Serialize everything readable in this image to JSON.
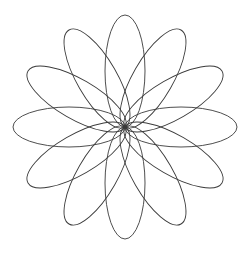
{
  "document": {
    "title": "Spirograph Rosette",
    "background_color": "#ffffff",
    "width": 248,
    "height": 256
  },
  "figure": {
    "name": "rosette-of-ellipses",
    "stroke_color": "#3a3a3a",
    "stroke_width": 0.9,
    "fill": "none"
  },
  "chart_data": {
    "type": "line",
    "subtitle": "",
    "xlabel": "",
    "ylabel": "",
    "grid": false,
    "legend_position": "none",
    "xlim": [
      0,
      248
    ],
    "ylim": [
      0,
      256
    ],
    "geometry": {
      "center_x": 125,
      "center_y": 127,
      "ellipse_count": 12,
      "semi_major_axis": 56,
      "semi_minor_axis": 20,
      "angle_step_degrees": 30,
      "start_angle_degrees": -90,
      "petal_tip_radius": 112,
      "bounding_box": {
        "left": 13,
        "top": 13,
        "right": 238,
        "bottom": 240
      }
    },
    "series": [
      {
        "name": "ellipse-01",
        "rotation_degrees": -90,
        "tip_x": 125,
        "tip_y": 15
      },
      {
        "name": "ellipse-02",
        "rotation_degrees": -60,
        "tip_x": 181,
        "tip_y": 30
      },
      {
        "name": "ellipse-03",
        "rotation_degrees": -30,
        "tip_x": 222,
        "tip_y": 71
      },
      {
        "name": "ellipse-04",
        "rotation_degrees": 0,
        "tip_x": 237,
        "tip_y": 127
      },
      {
        "name": "ellipse-05",
        "rotation_degrees": 30,
        "tip_x": 222,
        "tip_y": 183
      },
      {
        "name": "ellipse-06",
        "rotation_degrees": 60,
        "tip_x": 181,
        "tip_y": 224
      },
      {
        "name": "ellipse-07",
        "rotation_degrees": 90,
        "tip_x": 125,
        "tip_y": 239
      },
      {
        "name": "ellipse-08",
        "rotation_degrees": 120,
        "tip_x": 69,
        "tip_y": 224
      },
      {
        "name": "ellipse-09",
        "rotation_degrees": 150,
        "tip_x": 28,
        "tip_y": 183
      },
      {
        "name": "ellipse-10",
        "rotation_degrees": 180,
        "tip_x": 13,
        "tip_y": 127
      },
      {
        "name": "ellipse-11",
        "rotation_degrees": 210,
        "tip_x": 28,
        "tip_y": 71
      },
      {
        "name": "ellipse-12",
        "rotation_degrees": 240,
        "tip_x": 69,
        "tip_y": 30
      }
    ]
  }
}
